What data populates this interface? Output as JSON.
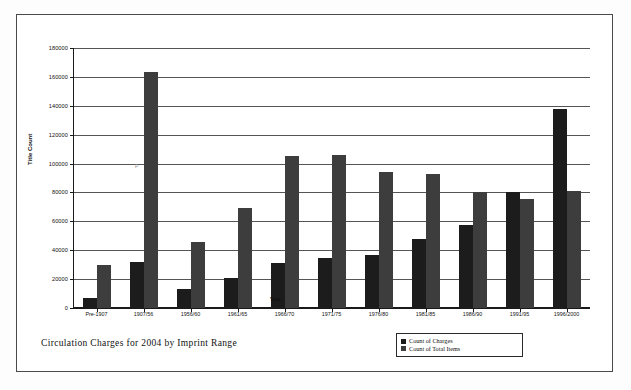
{
  "caption": "Circulation Charges for 2004 by Imprint Range",
  "artifact_mark": "P",
  "legend": {
    "position": "bottom-right",
    "entries": [
      {
        "label": "Count of Charges",
        "color": "#1c1c1c"
      },
      {
        "label": "Count of Total Items",
        "color": "#3d3d3d"
      }
    ]
  },
  "chart_data": {
    "type": "bar",
    "title": "Circulation Charges for 2004 by Imprint Range",
    "xlabel": "Year",
    "ylabel": "Title Count",
    "ylim": [
      0,
      180000
    ],
    "ytick_step": 20000,
    "ytick_labels": [
      "0",
      "20000",
      "40000",
      "60000",
      "80000",
      "100000",
      "120000",
      "140000",
      "160000",
      "180000"
    ],
    "ytick_values": [
      0,
      20000,
      40000,
      60000,
      80000,
      100000,
      120000,
      140000,
      160000,
      180000
    ],
    "grid": true,
    "categories": [
      "Pre-1907",
      "1907/56",
      "1956/60",
      "1961/65",
      "1966/70",
      "1971/75",
      "1976/80",
      "1981/85",
      "1986/90",
      "1991/95",
      "1996/2000"
    ],
    "series": [
      {
        "name": "Count of Charges",
        "color": "#1c1c1c",
        "values": [
          7000,
          32000,
          13000,
          20500,
          31000,
          34500,
          36500,
          47500,
          57500,
          80500,
          138000
        ]
      },
      {
        "name": "Count of Total Items",
        "color": "#3d3d3d",
        "values": [
          29500,
          163500,
          45500,
          69500,
          105000,
          106000,
          94000,
          92500,
          80500,
          75500,
          81000
        ]
      }
    ]
  }
}
